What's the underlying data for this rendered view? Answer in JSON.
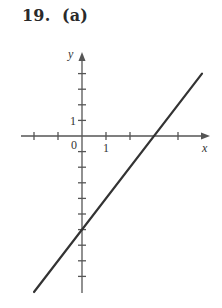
{
  "figure": {
    "title": "19.  (a)"
  },
  "chart_data": {
    "type": "line",
    "title": "19. (a)",
    "xlabel": "x",
    "ylabel": "y",
    "equation": "y = 2x - 6",
    "series": [
      {
        "name": "line",
        "x": [
          -2,
          5
        ],
        "y": [
          -10,
          4
        ]
      }
    ],
    "x_intercept": 3,
    "y_intercept": -6,
    "xlim": [
      -2.5,
      5.3
    ],
    "ylim": [
      -10,
      5.3
    ],
    "x_ticks": [
      -2,
      -1,
      1,
      2,
      4
    ],
    "y_ticks": [
      4,
      3,
      2,
      1,
      -1,
      -2,
      -3,
      -4,
      -5,
      -6,
      -7,
      -8,
      -9
    ],
    "tick_labels": {
      "origin": "0",
      "x_one": "1",
      "y_one": "1"
    },
    "grid": false,
    "legend": null,
    "color": "#333333",
    "axis_color": "#555555"
  },
  "layout": {
    "origin_px": [
      82,
      136
    ],
    "x_unit_px": 24,
    "y_unit_px": 15.6,
    "x_axis_px": [
      21,
      210
    ],
    "y_axis_px": [
      52,
      293
    ]
  }
}
